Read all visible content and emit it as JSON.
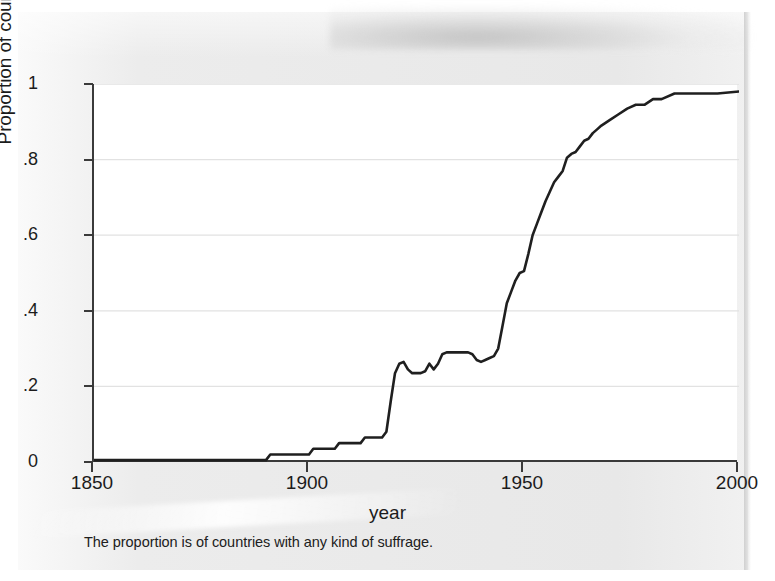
{
  "figure": {
    "note": "The proportion is of countries with any kind of suffrage.",
    "line_color": "#1f1f1f",
    "axis_color": "#3a3a3a",
    "grid_color": "#e2e2e2",
    "panel_color": "#ffffff",
    "page_color": "#ececec"
  },
  "chart_data": {
    "type": "line",
    "title": "",
    "subtitle": "",
    "xlabel": "year",
    "ylabel": "Proportion of countries",
    "note": "The proportion is of countries with any kind of suffrage.",
    "xlim": [
      1850,
      2000
    ],
    "ylim": [
      0,
      1
    ],
    "xticks": [
      1850,
      1900,
      1950,
      2000
    ],
    "xtick_labels": [
      "1850",
      "1900",
      "1950",
      "2000"
    ],
    "yticks": [
      0,
      0.2,
      0.4,
      0.6,
      0.8,
      1
    ],
    "ytick_labels": [
      "0",
      ".2",
      ".4",
      ".6",
      ".8",
      "1"
    ],
    "grid": "horizontal",
    "legend": "none",
    "series": [
      {
        "name": "Proportion of countries with any kind of suffrage",
        "x": [
          1850,
          1855,
          1860,
          1865,
          1870,
          1875,
          1880,
          1885,
          1888,
          1890,
          1891,
          1893,
          1895,
          1897,
          1899,
          1900,
          1901,
          1902,
          1904,
          1906,
          1907,
          1908,
          1910,
          1912,
          1913,
          1914,
          1915,
          1916,
          1917,
          1918,
          1919,
          1920,
          1921,
          1922,
          1923,
          1924,
          1925,
          1926,
          1927,
          1928,
          1929,
          1930,
          1931,
          1932,
          1933,
          1934,
          1935,
          1936,
          1937,
          1938,
          1939,
          1940,
          1941,
          1942,
          1943,
          1944,
          1945,
          1946,
          1947,
          1948,
          1949,
          1950,
          1951,
          1952,
          1953,
          1954,
          1955,
          1956,
          1957,
          1958,
          1959,
          1960,
          1961,
          1962,
          1963,
          1964,
          1965,
          1966,
          1967,
          1968,
          1970,
          1972,
          1974,
          1976,
          1978,
          1980,
          1982,
          1985,
          1990,
          1995,
          2000
        ],
        "y": [
          0.005,
          0.005,
          0.005,
          0.005,
          0.005,
          0.005,
          0.005,
          0.005,
          0.005,
          0.005,
          0.02,
          0.02,
          0.02,
          0.02,
          0.02,
          0.02,
          0.035,
          0.035,
          0.035,
          0.035,
          0.05,
          0.05,
          0.05,
          0.05,
          0.065,
          0.065,
          0.065,
          0.065,
          0.065,
          0.08,
          0.16,
          0.235,
          0.26,
          0.265,
          0.245,
          0.235,
          0.235,
          0.235,
          0.24,
          0.26,
          0.245,
          0.26,
          0.285,
          0.29,
          0.29,
          0.29,
          0.29,
          0.29,
          0.29,
          0.285,
          0.27,
          0.265,
          0.27,
          0.275,
          0.28,
          0.3,
          0.36,
          0.42,
          0.45,
          0.48,
          0.5,
          0.505,
          0.55,
          0.6,
          0.63,
          0.66,
          0.69,
          0.715,
          0.74,
          0.755,
          0.77,
          0.805,
          0.815,
          0.82,
          0.835,
          0.85,
          0.855,
          0.87,
          0.88,
          0.89,
          0.905,
          0.92,
          0.935,
          0.945,
          0.945,
          0.96,
          0.96,
          0.975,
          0.975,
          0.975,
          0.98
        ]
      }
    ]
  },
  "axes": {
    "y_title": "Proportion of countries",
    "x_title": "year"
  }
}
